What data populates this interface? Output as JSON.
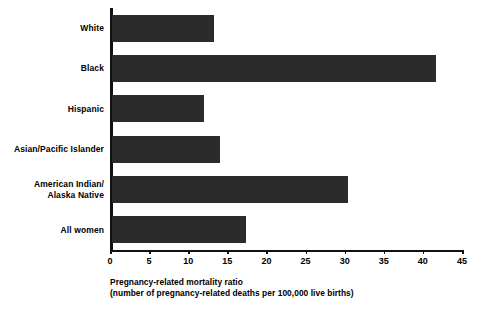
{
  "chart_data": {
    "type": "bar",
    "orientation": "horizontal",
    "title": "",
    "subtitle": "",
    "xlabel": "Pregnancy-related mortality ratio (number of pregnancy-related deaths per 100,000 live births)",
    "ylabel": "",
    "categories": [
      "White",
      "Black",
      "Hispanic",
      "Asian/Pacific Islander",
      "American Indian/\nAlaska Native",
      "All women"
    ],
    "values": [
      13.1,
      41.4,
      11.7,
      13.8,
      30.2,
      17.1
    ],
    "xlim": [
      0,
      45
    ],
    "ylim": null,
    "xticks": [
      0,
      5,
      10,
      15,
      20,
      25,
      30,
      35,
      40,
      45
    ],
    "xtick_labels": [
      "0",
      "5",
      "10",
      "15",
      "20",
      "25",
      "30",
      "35",
      "40",
      "45"
    ],
    "grid": false,
    "legend": null,
    "bar_color": "#2b2b2b",
    "axis_color": "#111111",
    "background_color": "#ffffff"
  },
  "caption": {
    "line1": "Pregnancy-related mortality ratio",
    "line2": "(number of pregnancy-related deaths per 100,000 live births)"
  }
}
